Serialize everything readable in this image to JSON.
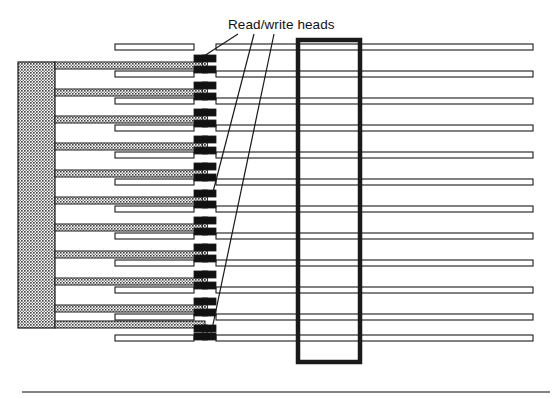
{
  "figure": {
    "kind": "technical-diagram",
    "width": 558,
    "height": 399,
    "background_color": "#ffffff"
  },
  "labels": {
    "read_write_heads": {
      "text": "Read/write heads",
      "x": 228,
      "y": 17,
      "font_size": 13.5,
      "color": "#111111"
    }
  },
  "colors": {
    "ink": "#1a1a1a",
    "head_block": "#111111",
    "arm_fill": "#8d8d8d",
    "actuator_fill": "#9a9a9a",
    "platter_fill": "#ffffff",
    "rule": "#5a5a5a",
    "leader_line": "#1a1a1a"
  },
  "actuator_block": {
    "name": "actuator-comb-body",
    "x": 18,
    "y": 62,
    "width": 37,
    "height": 266,
    "stroke_width": 1.2
  },
  "arms": {
    "name": "head-arm",
    "x_start": 55,
    "x_end": 205,
    "height": 7,
    "stroke_width": 1,
    "y_positions": [
      62,
      89,
      116,
      143,
      170,
      197,
      224,
      251,
      278,
      305,
      321
    ]
  },
  "platters": {
    "name": "platter-disc",
    "x_start": 115,
    "x_end": 533,
    "height": 6,
    "stroke_width": 1.1,
    "y_positions": [
      44,
      71,
      98,
      125,
      152,
      179,
      206,
      233,
      260,
      287,
      314,
      335
    ]
  },
  "heads": {
    "name": "read-write-head",
    "x": 194,
    "width": 22,
    "height": 7,
    "stem_width": 5,
    "pairs": [
      {
        "top_y": 55,
        "bottom_y": 66
      },
      {
        "top_y": 82,
        "bottom_y": 93
      },
      {
        "top_y": 109,
        "bottom_y": 120
      },
      {
        "top_y": 136,
        "bottom_y": 147
      },
      {
        "top_y": 163,
        "bottom_y": 174
      },
      {
        "top_y": 190,
        "bottom_y": 201
      },
      {
        "top_y": 217,
        "bottom_y": 228
      },
      {
        "top_y": 244,
        "bottom_y": 255
      },
      {
        "top_y": 271,
        "bottom_y": 282
      },
      {
        "top_y": 298,
        "bottom_y": 309
      },
      {
        "top_y": 325,
        "bottom_y": 333
      }
    ]
  },
  "spindle_housing": {
    "name": "spindle-housing-outline",
    "x": 298,
    "y": 40,
    "width": 62,
    "height": 322,
    "stroke_width": 4.5
  },
  "leader_lines": [
    {
      "name": "leader-line-top",
      "x1": 238,
      "y1": 34,
      "x2": 204,
      "y2": 56
    },
    {
      "name": "leader-line-middle",
      "x1": 254,
      "y1": 34,
      "x2": 213,
      "y2": 192
    },
    {
      "name": "leader-line-bottom",
      "x1": 274,
      "y1": 34,
      "x2": 211,
      "y2": 334
    }
  ],
  "bottom_rule": {
    "name": "footer-rule",
    "x1": 22,
    "x2": 550,
    "y": 392,
    "stroke_width": 1.4
  }
}
